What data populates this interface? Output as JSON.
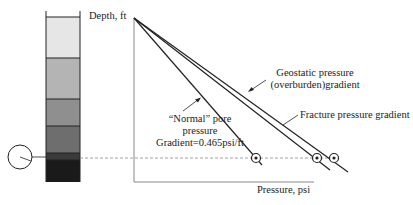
{
  "diagram": {
    "axis": {
      "y_label": "Depth, ft",
      "x_label": "Pressure, psi"
    },
    "curves": [
      {
        "name": "normal-pore-pressure",
        "label_lines": [
          "“Normal” pore",
          "pressure",
          "Gradient=0.465psi/ft"
        ]
      },
      {
        "name": "fracture-pressure",
        "label_lines": [
          "Fracture pressure gradient"
        ]
      },
      {
        "name": "geostatic-pressure",
        "label_lines": [
          "Geostatic pressure",
          "(overburden)gradient"
        ]
      }
    ],
    "strata_colors": [
      "#e6e6e6",
      "#b4b4b4",
      "#8f8f8f",
      "#6e6e6e",
      "#3a3a3a",
      "#1a1a1a"
    ],
    "colors": {
      "line": "#222222",
      "dash": "#888888"
    }
  }
}
